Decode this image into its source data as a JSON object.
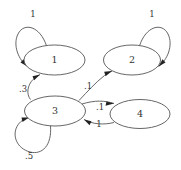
{
  "diagram": {
    "type": "state-transition-diagram",
    "title": "",
    "background_color": "#ffffff",
    "node_stroke_color": "#555555",
    "edge_stroke_color": "#555555",
    "arrow_color": "#222222",
    "text_color": "#333333",
    "nodes": [
      {
        "id": "1",
        "label": "1",
        "cx": 54.5,
        "cy": 60.0,
        "rx": 30.5,
        "ry": 15.0
      },
      {
        "id": "2",
        "label": "2",
        "cx": 132.0,
        "cy": 60.0,
        "rx": 28.5,
        "ry": 15.0
      },
      {
        "id": "3",
        "label": "3",
        "cx": 55.0,
        "cy": 111.0,
        "rx": 30.5,
        "ry": 15.0
      },
      {
        "id": "4",
        "label": "4",
        "cx": 140.0,
        "cy": 114.0,
        "rx": 30.0,
        "ry": 14.5
      }
    ],
    "edges": [
      {
        "id": "e1",
        "from": "1",
        "to": "1",
        "label": "1",
        "kind": "self-loop",
        "label_x": 33,
        "label_y": 14
      },
      {
        "id": "e2",
        "from": "2",
        "to": "2",
        "label": "1",
        "kind": "self-loop",
        "label_x": 152,
        "label_y": 14
      },
      {
        "id": "e3",
        "from": "3",
        "to": "3",
        "label": ".5",
        "kind": "self-loop",
        "label_x": 29,
        "label_y": 156
      },
      {
        "id": "e4",
        "from": "3",
        "to": "1",
        "label": ".3",
        "kind": "transition",
        "label_x": 23,
        "label_y": 89
      },
      {
        "id": "e5",
        "from": "3",
        "to": "2",
        "label": ".1",
        "kind": "transition",
        "label_x": 88,
        "label_y": 86
      },
      {
        "id": "e6",
        "from": "3",
        "to": "4",
        "label": ".1",
        "kind": "transition",
        "label_x": 100,
        "label_y": 107
      },
      {
        "id": "e7",
        "from": "4",
        "to": "3",
        "label": "1",
        "kind": "transition",
        "label_x": 99,
        "label_y": 124
      }
    ]
  }
}
